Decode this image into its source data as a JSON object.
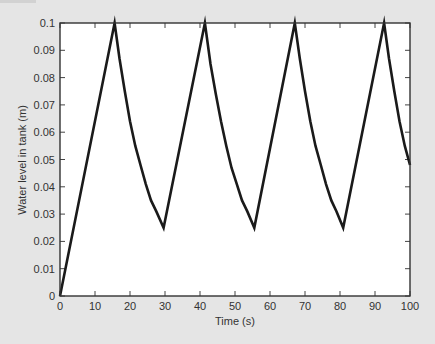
{
  "chart_data": {
    "type": "line",
    "title": "",
    "xlabel": "Time (s)",
    "ylabel": "Water level in tank (m)",
    "xlim": [
      0,
      100
    ],
    "ylim": [
      0,
      0.1
    ],
    "grid": false,
    "legend": null,
    "xticks": [
      "0",
      "10",
      "20",
      "30",
      "40",
      "50",
      "60",
      "70",
      "80",
      "90",
      "100"
    ],
    "yticks": [
      "0",
      "0.01",
      "0.02",
      "0.03",
      "0.04",
      "0.05",
      "0.06",
      "0.07",
      "0.08",
      "0.09",
      "0.1"
    ],
    "series": [
      {
        "name": "Water level",
        "color": "#1a1a1a",
        "x": [
          0,
          15.6,
          17.0,
          18.5,
          20.0,
          21.5,
          23.0,
          24.5,
          26.0,
          27.5,
          29.6,
          41.4,
          43.0,
          44.5,
          46.0,
          47.5,
          49.0,
          50.5,
          52.0,
          53.5,
          55.5,
          67.1,
          68.5,
          70.0,
          71.5,
          73.0,
          74.5,
          76.0,
          77.5,
          79.0,
          80.9,
          92.6,
          94.0,
          95.5,
          97.0,
          98.5,
          100
        ],
        "y": [
          0,
          0.1,
          0.087,
          0.075,
          0.064,
          0.055,
          0.048,
          0.041,
          0.035,
          0.031,
          0.025,
          0.1,
          0.085,
          0.074,
          0.064,
          0.055,
          0.047,
          0.041,
          0.035,
          0.031,
          0.025,
          0.1,
          0.087,
          0.075,
          0.064,
          0.055,
          0.048,
          0.041,
          0.035,
          0.031,
          0.025,
          0.1,
          0.087,
          0.075,
          0.064,
          0.055,
          0.048
        ]
      }
    ],
    "annotations": {
      "peaks": [
        {
          "t": 15.6,
          "level": 0.1
        },
        {
          "t": 41.6,
          "level": 0.1
        },
        {
          "t": 67.1,
          "level": 0.1
        },
        {
          "t": 92.6,
          "level": 0.1
        }
      ],
      "troughs": [
        {
          "t": 29.7,
          "level": 0.025
        },
        {
          "t": 55.5,
          "level": 0.025
        },
        {
          "t": 80.8,
          "level": 0.025
        }
      ],
      "end_value": {
        "t": 100,
        "level": 0.048
      }
    }
  },
  "colors": {
    "background": "#e5e5e5",
    "plot_area": "#ffffff",
    "frame": "#333333",
    "line": "#1a1a1a"
  }
}
